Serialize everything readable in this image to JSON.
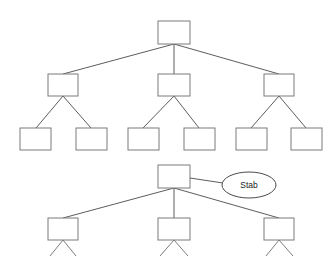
{
  "canvas": {
    "width": 336,
    "height": 256,
    "background": "#ffffff",
    "description": "Two hierarchical tree diagrams drawn with empty rectangular nodes; the lower tree is annotated with a labeled ellipse and is cropped at the bottom edge."
  },
  "style": {
    "node_fill": "#ffffff",
    "node_stroke": "#7a7a7a",
    "edge_stroke": "#4a4a4a",
    "ellipse_stroke": "#4a4a4a",
    "label_color": "#1a1a1a"
  },
  "diagrams": [
    {
      "id": "upper-tree",
      "name": "upper-tree",
      "levels": 3,
      "node_counts": [
        1,
        3,
        6
      ],
      "nodes": [
        {
          "id": "u-root",
          "label": "",
          "x": 158,
          "y": 21,
          "w": 32,
          "h": 23
        },
        {
          "id": "u-l2-a",
          "label": "",
          "x": 48,
          "y": 74,
          "w": 30,
          "h": 22
        },
        {
          "id": "u-l2-b",
          "label": "",
          "x": 158,
          "y": 74,
          "w": 32,
          "h": 22
        },
        {
          "id": "u-l2-c",
          "label": "",
          "x": 264,
          "y": 74,
          "w": 30,
          "h": 22
        },
        {
          "id": "u-l3-a",
          "label": "",
          "x": 20,
          "y": 128,
          "w": 31,
          "h": 22
        },
        {
          "id": "u-l3-b",
          "label": "",
          "x": 76,
          "y": 128,
          "w": 31,
          "h": 22
        },
        {
          "id": "u-l3-c",
          "label": "",
          "x": 128,
          "y": 128,
          "w": 31,
          "h": 22
        },
        {
          "id": "u-l3-d",
          "label": "",
          "x": 184,
          "y": 128,
          "w": 31,
          "h": 22
        },
        {
          "id": "u-l3-e",
          "label": "",
          "x": 236,
          "y": 128,
          "w": 31,
          "h": 22
        },
        {
          "id": "u-l3-f",
          "label": "",
          "x": 291,
          "y": 128,
          "w": 31,
          "h": 22
        }
      ],
      "edges": [
        {
          "from": "u-root",
          "to": "u-l2-a"
        },
        {
          "from": "u-root",
          "to": "u-l2-b"
        },
        {
          "from": "u-root",
          "to": "u-l2-c"
        },
        {
          "from": "u-l2-a",
          "to": "u-l3-a"
        },
        {
          "from": "u-l2-a",
          "to": "u-l3-b"
        },
        {
          "from": "u-l2-b",
          "to": "u-l3-c"
        },
        {
          "from": "u-l2-b",
          "to": "u-l3-d"
        },
        {
          "from": "u-l2-c",
          "to": "u-l3-e"
        },
        {
          "from": "u-l2-c",
          "to": "u-l3-f"
        }
      ]
    },
    {
      "id": "lower-tree",
      "name": "lower-tree",
      "levels": 3,
      "node_counts": [
        1,
        3,
        6
      ],
      "cropped_at_bottom": true,
      "nodes": [
        {
          "id": "l-root",
          "label": "",
          "x": 158,
          "y": 165,
          "w": 32,
          "h": 23
        },
        {
          "id": "l-l2-a",
          "label": "",
          "x": 48,
          "y": 218,
          "w": 30,
          "h": 22
        },
        {
          "id": "l-l2-b",
          "label": "",
          "x": 158,
          "y": 218,
          "w": 32,
          "h": 22
        },
        {
          "id": "l-l2-c",
          "label": "",
          "x": 264,
          "y": 218,
          "w": 30,
          "h": 22
        }
      ],
      "edges": [
        {
          "from": "l-root",
          "to": "l-l2-a"
        },
        {
          "from": "l-root",
          "to": "l-l2-b"
        },
        {
          "from": "l-root",
          "to": "l-l2-c"
        }
      ],
      "partial_edges": [
        {
          "from": "l-l2-a",
          "to_x": 50,
          "to_y": 256
        },
        {
          "from": "l-l2-a",
          "to_x": 76,
          "to_y": 256
        },
        {
          "from": "l-l2-b",
          "to_x": 160,
          "to_y": 256
        },
        {
          "from": "l-l2-b",
          "to_x": 186,
          "to_y": 256
        },
        {
          "from": "l-l2-c",
          "to_x": 266,
          "to_y": 256
        },
        {
          "from": "l-l2-c",
          "to_x": 292,
          "to_y": 256
        }
      ]
    }
  ],
  "annotations": [
    {
      "id": "stab-annotation",
      "name": "stab-annotation",
      "label": "Stab",
      "shape": "ellipse",
      "cx": 249,
      "cy": 185,
      "rx": 27,
      "ry": 13,
      "connector": {
        "from_x": 190,
        "from_y": 178,
        "to_x": 222,
        "to_y": 183
      },
      "attached_to": "l-root"
    }
  ]
}
